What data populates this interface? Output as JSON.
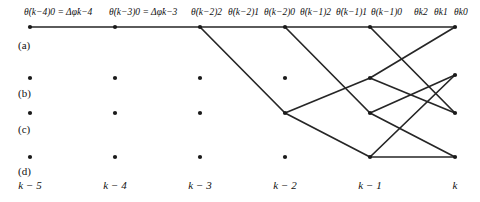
{
  "figure": {
    "kind": "trellis-survivor-paths",
    "width": 480,
    "height": 202,
    "node_color": "#1a1a1a",
    "edge_color": "#262626"
  },
  "top_labels": [
    {
      "id": "lbl-km4-0",
      "text": "θ̇(k−4)0 = Δφ̇k−4",
      "x": 24,
      "y": 8
    },
    {
      "id": "lbl-km3-0",
      "text": "θ̇(k−3)0 = Δφ̇k−3",
      "x": 109,
      "y": 8
    },
    {
      "id": "lbl-km2-2",
      "text": "θ̇(k−2)2",
      "x": 191,
      "y": 8
    },
    {
      "id": "lbl-km2-1",
      "text": "θ̇(k−2)1",
      "x": 228,
      "y": 8
    },
    {
      "id": "lbl-km2-0",
      "text": "θ(k−2)0",
      "x": 264,
      "y": 8
    },
    {
      "id": "lbl-km1-2",
      "text": "θ̇(k−1)2",
      "x": 300,
      "y": 8
    },
    {
      "id": "lbl-km1-1",
      "text": "θ̇(k−1)1",
      "x": 336,
      "y": 8
    },
    {
      "id": "lbl-km1-0",
      "text": "θ(k−1)0",
      "x": 371,
      "y": 8
    },
    {
      "id": "lbl-k-2",
      "text": "θk2",
      "x": 414,
      "y": 8
    },
    {
      "id": "lbl-k-1",
      "text": "θk1",
      "x": 434,
      "y": 8
    },
    {
      "id": "lbl-k-0",
      "text": "θk0",
      "x": 454,
      "y": 8
    }
  ],
  "row_labels": [
    {
      "id": "row-a",
      "text": "(a)",
      "x": 18,
      "y": 40
    },
    {
      "id": "row-b",
      "text": "(b)",
      "x": 18,
      "y": 88
    },
    {
      "id": "row-c",
      "text": "(c)",
      "x": 18,
      "y": 124
    },
    {
      "id": "row-d",
      "text": "(d)",
      "x": 18,
      "y": 166
    }
  ],
  "axis_labels": [
    {
      "id": "ax-km5",
      "text": "k − 5",
      "x": 30,
      "y": 180
    },
    {
      "id": "ax-km4",
      "text": "k − 4",
      "x": 115,
      "y": 180
    },
    {
      "id": "ax-km3",
      "text": "k − 3",
      "x": 200,
      "y": 180
    },
    {
      "id": "ax-km2",
      "text": "k − 2",
      "x": 285,
      "y": 180
    },
    {
      "id": "ax-km1",
      "text": "k − 1",
      "x": 370,
      "y": 180
    },
    {
      "id": "ax-k",
      "text": "k",
      "x": 455,
      "y": 180
    }
  ],
  "chart_data": {
    "type": "scatter",
    "title": "",
    "xlabel": "",
    "ylabel": "",
    "columns": [
      "k − 5",
      "k − 4",
      "k − 3",
      "k − 2",
      "k − 1",
      "k"
    ],
    "column_x": [
      30,
      115,
      200,
      285,
      370,
      455
    ],
    "rows": [
      "(a)",
      "(b)",
      "(c)",
      "(d)"
    ],
    "row_y": [
      27,
      78,
      113,
      157
    ],
    "nodes": [
      {
        "col": 0,
        "row": 0,
        "x": 30,
        "y": 27
      },
      {
        "col": 1,
        "row": 0,
        "x": 115,
        "y": 27
      },
      {
        "col": 2,
        "row": 0,
        "x": 200,
        "y": 27
      },
      {
        "col": 3,
        "row": 0,
        "x": 285,
        "y": 27
      },
      {
        "col": 4,
        "row": 0,
        "x": 370,
        "y": 27
      },
      {
        "col": 5,
        "row": 0,
        "x": 455,
        "y": 27
      },
      {
        "col": 0,
        "row": 1,
        "x": 30,
        "y": 78
      },
      {
        "col": 1,
        "row": 1,
        "x": 115,
        "y": 78
      },
      {
        "col": 2,
        "row": 1,
        "x": 200,
        "y": 78
      },
      {
        "col": 3,
        "row": 1,
        "x": 285,
        "y": 78
      },
      {
        "col": 4,
        "row": 1,
        "x": 370,
        "y": 78
      },
      {
        "col": 5,
        "row": 1,
        "x": 455,
        "y": 75
      },
      {
        "col": 0,
        "row": 2,
        "x": 30,
        "y": 113
      },
      {
        "col": 1,
        "row": 2,
        "x": 115,
        "y": 113
      },
      {
        "col": 2,
        "row": 2,
        "x": 200,
        "y": 113
      },
      {
        "col": 3,
        "row": 2,
        "x": 285,
        "y": 113
      },
      {
        "col": 4,
        "row": 2,
        "x": 370,
        "y": 113
      },
      {
        "col": 5,
        "row": 2,
        "x": 455,
        "y": 113
      },
      {
        "col": 0,
        "row": 3,
        "x": 30,
        "y": 157
      },
      {
        "col": 1,
        "row": 3,
        "x": 115,
        "y": 157
      },
      {
        "col": 2,
        "row": 3,
        "x": 200,
        "y": 157
      },
      {
        "col": 3,
        "row": 3,
        "x": 285,
        "y": 157
      },
      {
        "col": 4,
        "row": 3,
        "x": 370,
        "y": 157
      },
      {
        "col": 5,
        "row": 3,
        "x": 455,
        "y": 157
      }
    ],
    "edges": [
      {
        "x1": 30,
        "y1": 27,
        "x2": 115,
        "y2": 27
      },
      {
        "x1": 115,
        "y1": 27,
        "x2": 200,
        "y2": 27
      },
      {
        "x1": 200,
        "y1": 27,
        "x2": 285,
        "y2": 27
      },
      {
        "x1": 285,
        "y1": 27,
        "x2": 370,
        "y2": 27
      },
      {
        "x1": 370,
        "y1": 27,
        "x2": 455,
        "y2": 27
      },
      {
        "x1": 200,
        "y1": 27,
        "x2": 285,
        "y2": 113
      },
      {
        "x1": 285,
        "y1": 27,
        "x2": 370,
        "y2": 113
      },
      {
        "x1": 370,
        "y1": 27,
        "x2": 455,
        "y2": 113
      },
      {
        "x1": 285,
        "y1": 113,
        "x2": 370,
        "y2": 78
      },
      {
        "x1": 285,
        "y1": 113,
        "x2": 370,
        "y2": 157
      },
      {
        "x1": 370,
        "y1": 78,
        "x2": 455,
        "y2": 27
      },
      {
        "x1": 370,
        "y1": 78,
        "x2": 455,
        "y2": 113
      },
      {
        "x1": 370,
        "y1": 157,
        "x2": 455,
        "y2": 157
      },
      {
        "x1": 370,
        "y1": 157,
        "x2": 455,
        "y2": 75
      },
      {
        "x1": 370,
        "y1": 113,
        "x2": 455,
        "y2": 75
      },
      {
        "x1": 370,
        "y1": 113,
        "x2": 455,
        "y2": 157
      }
    ]
  }
}
